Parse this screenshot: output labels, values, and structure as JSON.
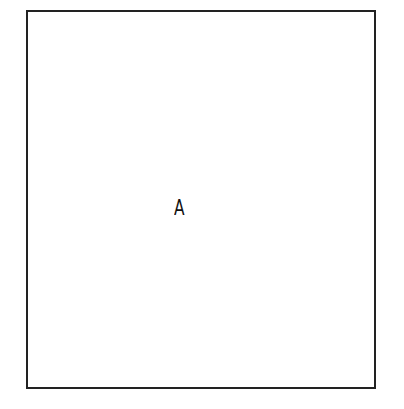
{
  "diagram": {
    "type": "single-box",
    "box": {
      "label": "A",
      "border_color": "#222222",
      "background": "#ffffff"
    }
  }
}
